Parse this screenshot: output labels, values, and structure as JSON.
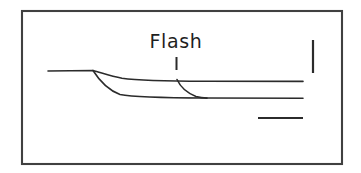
{
  "figure": {
    "caption_label": "Flash",
    "background_color": "#ffffff",
    "frame": {
      "stroke_color": "#404040",
      "x": 22,
      "y": 11,
      "width": 320,
      "height": 153
    },
    "annotations": {
      "flash_text": "Flash",
      "flash_text_x": 176,
      "flash_text_y": 48,
      "flash_tick_label": "flash-onset-marker",
      "flash_tick_x": 176,
      "flash_tick_y_top": 57,
      "flash_tick_y_bottom": 70
    },
    "scale_bars": {
      "vertical_label": "vertical-scale-bar",
      "vertical_x": 313,
      "vertical_y_top": 40,
      "vertical_y_bottom": 73,
      "horizontal_label": "horizontal-scale-bar",
      "horizontal_y": 118,
      "horizontal_x_left": 258,
      "horizontal_x_right": 303
    }
  },
  "chart_data": {
    "type": "line",
    "title": "Flash",
    "xlabel": "",
    "ylabel": "",
    "grid": false,
    "legend_position": "none",
    "stroke_color": "#2b2b2b",
    "xlim": [
      22,
      342
    ],
    "ylim": [
      11,
      164
    ],
    "annotations": [
      {
        "text": "Flash",
        "x": 176,
        "y": 48,
        "type": "label"
      },
      {
        "text": "",
        "x": 176,
        "y_top": 57,
        "y_bottom": 70,
        "type": "event-tick"
      }
    ],
    "scale_bars": [
      {
        "orientation": "vertical",
        "x": 313,
        "y_start": 40,
        "y_end": 73
      },
      {
        "orientation": "horizontal",
        "y": 118,
        "x_start": 258,
        "x_end": 303
      }
    ],
    "series": [
      {
        "name": "baseline-and-upper-trace",
        "description": "flat baseline from left, small downward step at branch point, then near-flat upper trace to right edge",
        "path": "M 48 71 L 93 70.5 C 101 72.5 110 76.2 122 78.2 C 140 80.6 170 81.1 205 81.3 L 303 81.4",
        "points": [
          {
            "x": 48,
            "y": 71
          },
          {
            "x": 93,
            "y": 70.5
          },
          {
            "x": 122,
            "y": 78.2
          },
          {
            "x": 160,
            "y": 80.8
          },
          {
            "x": 205,
            "y": 81.3
          },
          {
            "x": 303,
            "y": 81.4
          }
        ]
      },
      {
        "name": "lower-trace",
        "description": "second branch descending more steeply from the same branch point to a lower plateau",
        "path": "M 93 70.5 C 99 80 108 90 120 94.5 C 134 97.2 160 97.8 205 98.0 L 303 98.2",
        "points": [
          {
            "x": 93,
            "y": 70.5
          },
          {
            "x": 110,
            "y": 88.0
          },
          {
            "x": 125,
            "y": 96.0
          },
          {
            "x": 160,
            "y": 97.8
          },
          {
            "x": 205,
            "y": 98.0
          },
          {
            "x": 303,
            "y": 98.2
          }
        ]
      },
      {
        "name": "flash-evoked-descent",
        "description": "curve leaving the upper trace at the flash marker and joining the lower plateau",
        "path": "M 177 79.5 C 180 86 187 93 196 96.4 C 200 97.5 203 97.9 207 98.1",
        "points": [
          {
            "x": 177,
            "y": 79.5
          },
          {
            "x": 188,
            "y": 91.0
          },
          {
            "x": 198,
            "y": 97.0
          },
          {
            "x": 207,
            "y": 98.1
          }
        ]
      }
    ]
  }
}
